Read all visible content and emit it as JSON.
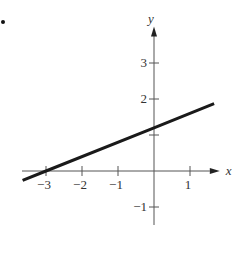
{
  "bullet": "•",
  "chart_data": {
    "type": "line",
    "title": "",
    "xlabel": "x",
    "ylabel": "y",
    "xlim": [
      -3.65,
      1.7
    ],
    "ylim": [
      -1.4,
      3.6
    ],
    "grid": false,
    "legend": null,
    "x_ticks": [
      -3,
      -2,
      -1,
      1
    ],
    "x_tick_labels": [
      "−3",
      "−2",
      "−1",
      "1"
    ],
    "y_ticks": [
      -1,
      1,
      2,
      3
    ],
    "y_tick_labels": [
      "−1",
      "",
      "2",
      "3"
    ],
    "series": [
      {
        "name": "line",
        "equation": "y = 0.4x + 1.2",
        "x": [
          -3.65,
          -3,
          0,
          1.67
        ],
        "y": [
          -0.26,
          0,
          1.2,
          1.87
        ]
      }
    ],
    "annotations": [
      "x-intercept at -3",
      "y-intercept at 1.2"
    ]
  },
  "layout": {
    "origin_px": [
      154,
      171
    ],
    "unit_px": 36,
    "axis_color": "#555555",
    "line_color": "#1a1a1a",
    "text_color": "#333333"
  }
}
